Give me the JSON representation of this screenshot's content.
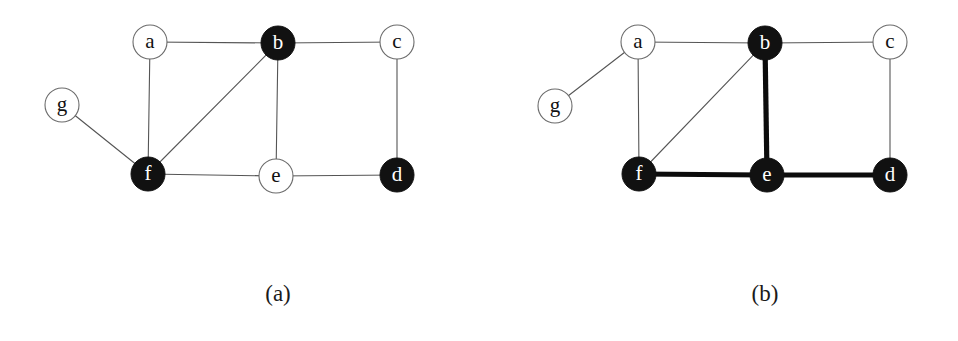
{
  "figure": {
    "width": 958,
    "height": 341,
    "background": "#ffffff",
    "node_radius": 17,
    "colors": {
      "filled_node": "#111111",
      "open_node": "#ffffff",
      "node_stroke": "#6b6b6b",
      "thin_edge": "#555555",
      "thick_edge": "#0c0c0c",
      "label_dark": "#111111",
      "label_light": "#ffffff"
    },
    "panels": [
      {
        "id": "panel-a",
        "caption": "(a)",
        "caption_x": 278,
        "caption_y": 295,
        "nodes": [
          {
            "id": "a",
            "label": "a",
            "x": 150,
            "y": 42,
            "filled": false
          },
          {
            "id": "b",
            "label": "b",
            "x": 278,
            "y": 43,
            "filled": true
          },
          {
            "id": "c",
            "label": "c",
            "x": 397,
            "y": 42,
            "filled": false
          },
          {
            "id": "d",
            "label": "d",
            "x": 397,
            "y": 175,
            "filled": true
          },
          {
            "id": "e",
            "label": "e",
            "x": 276,
            "y": 176,
            "filled": false
          },
          {
            "id": "f",
            "label": "f",
            "x": 148,
            "y": 174,
            "filled": true
          },
          {
            "id": "g",
            "label": "g",
            "x": 62,
            "y": 105,
            "filled": false
          }
        ],
        "edges": [
          {
            "from": "a",
            "to": "b",
            "thick": false
          },
          {
            "from": "b",
            "to": "c",
            "thick": false
          },
          {
            "from": "a",
            "to": "f",
            "thick": false
          },
          {
            "from": "b",
            "to": "f",
            "thick": false
          },
          {
            "from": "b",
            "to": "e",
            "thick": false
          },
          {
            "from": "c",
            "to": "d",
            "thick": false
          },
          {
            "from": "g",
            "to": "f",
            "thick": false
          },
          {
            "from": "f",
            "to": "e",
            "thick": false
          },
          {
            "from": "e",
            "to": "d",
            "thick": false
          }
        ]
      },
      {
        "id": "panel-b",
        "caption": "(b)",
        "caption_x": 765,
        "caption_y": 295,
        "nodes": [
          {
            "id": "a",
            "label": "a",
            "x": 638,
            "y": 42,
            "filled": false
          },
          {
            "id": "b",
            "label": "b",
            "x": 765,
            "y": 43,
            "filled": true
          },
          {
            "id": "c",
            "label": "c",
            "x": 890,
            "y": 42,
            "filled": false
          },
          {
            "id": "d",
            "label": "d",
            "x": 890,
            "y": 175,
            "filled": true
          },
          {
            "id": "e",
            "label": "e",
            "x": 767,
            "y": 175,
            "filled": true
          },
          {
            "id": "f",
            "label": "f",
            "x": 639,
            "y": 174,
            "filled": true
          },
          {
            "id": "g",
            "label": "g",
            "x": 555,
            "y": 106,
            "filled": false
          }
        ],
        "edges": [
          {
            "from": "a",
            "to": "b",
            "thick": false
          },
          {
            "from": "b",
            "to": "c",
            "thick": false
          },
          {
            "from": "a",
            "to": "f",
            "thick": false
          },
          {
            "from": "b",
            "to": "f",
            "thick": false
          },
          {
            "from": "c",
            "to": "d",
            "thick": false
          },
          {
            "from": "g",
            "to": "a",
            "thick": false
          },
          {
            "from": "b",
            "to": "e",
            "thick": true
          },
          {
            "from": "f",
            "to": "e",
            "thick": true
          },
          {
            "from": "e",
            "to": "d",
            "thick": true
          }
        ]
      }
    ]
  }
}
